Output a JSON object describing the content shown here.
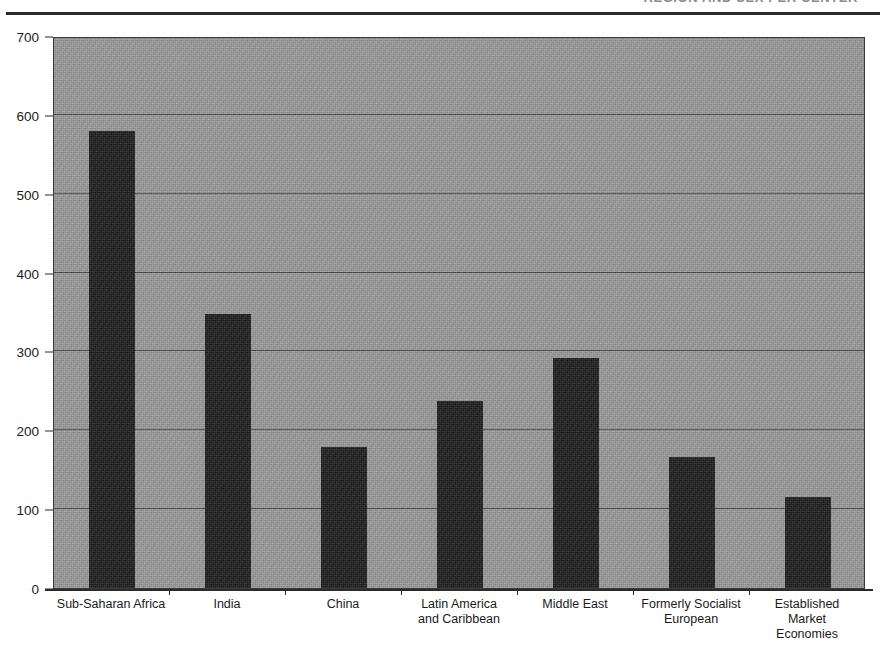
{
  "header": {
    "title_remnant": "REGION AND SEX PER CENTER",
    "rule": "horizontal-rule"
  },
  "chart_data": {
    "type": "bar",
    "title": "",
    "subtitle": "",
    "xlabel": "",
    "ylabel": "",
    "ylim": [
      0,
      700
    ],
    "yticks": [
      0,
      100,
      200,
      300,
      400,
      500,
      600,
      700
    ],
    "ytick_labels": [
      "0",
      "100",
      "200",
      "300",
      "400",
      "500",
      "600",
      "700"
    ],
    "grid": true,
    "grid_axis": "y",
    "legend": "none",
    "bar_color": "#1a1a1a",
    "plot_background": "#9d9d9d",
    "categories": [
      "Sub-Saharan Africa",
      "India",
      "China",
      "Latin America\nand Caribbean",
      "Middle East",
      "Formerly Socialist\nEuropean",
      "Established\nMarket\nEconomies"
    ],
    "values": [
      580,
      347,
      179,
      237,
      292,
      166,
      115
    ]
  },
  "colors": {
    "bar": "#1a1a1a",
    "plot_bg": "#9d9d9d",
    "axis": "#2b2b2b",
    "gridline": "#3b3b3b",
    "text": "#1a1a1a",
    "page_bg": "#ffffff"
  }
}
